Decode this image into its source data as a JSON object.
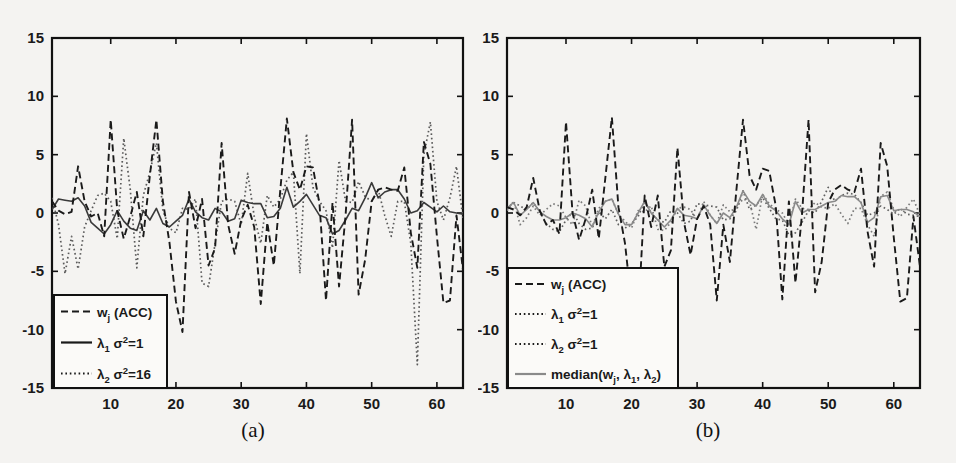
{
  "figure": {
    "background_color": "#f4f3f1",
    "ink_color": "#1a1a1a",
    "panels": [
      "a",
      "b"
    ]
  },
  "panel_a": {
    "caption": "(a)",
    "legend": {
      "items": [
        {
          "label_main": "w",
          "label_sub": "j",
          "label_rest": " (ACC)",
          "style": "dashed"
        },
        {
          "label_main": "λ",
          "label_sub": "1",
          "label_rest": " σ",
          "label_sup": "2",
          "label_tail": "=1",
          "style": "solid"
        },
        {
          "label_main": "λ",
          "label_sub": "2",
          "label_rest": " σ",
          "label_sup": "2",
          "label_tail": "=16",
          "style": "dotted"
        }
      ]
    }
  },
  "panel_b": {
    "caption": "(b)",
    "legend": {
      "items": [
        {
          "label_main": "w",
          "label_sub": "j",
          "label_rest": " (ACC)",
          "style": "dashed"
        },
        {
          "label_main": "λ",
          "label_sub": "1",
          "label_rest": " σ",
          "label_sup": "2",
          "label_tail": "=1",
          "style": "dotted"
        },
        {
          "label_main": "λ",
          "label_sub": "2",
          "label_rest": " σ",
          "label_sup": "2",
          "label_tail": "=1",
          "style": "dotted"
        },
        {
          "label_main": "median(w",
          "label_sub": "j",
          "label_rest": ", λ",
          "label_sup2": "1",
          "label_rest2": ", λ",
          "label_sup3": "2",
          "label_tail": ")",
          "style": "solid-gray"
        }
      ]
    }
  },
  "chart_data": [
    {
      "id": "a",
      "type": "line",
      "title": "(a)",
      "xlabel": "",
      "ylabel": "",
      "xlim": [
        1,
        64
      ],
      "ylim": [
        -15,
        15
      ],
      "xticks": [
        10,
        20,
        30,
        40,
        50,
        60
      ],
      "yticks": [
        15,
        10,
        5,
        0,
        -5,
        -10,
        -15
      ],
      "grid": false,
      "legend_position": "lower-left",
      "series": [
        {
          "name": "w_j (ACC)",
          "style": "dashed",
          "color": "#1a1a1a",
          "values": [
            1.0,
            0.2,
            -0.1,
            0.1,
            4.0,
            1.0,
            -0.3,
            0.0,
            -2.0,
            8.0,
            0.2,
            -2.2,
            -0.3,
            1.8,
            -2.0,
            3.2,
            8.0,
            1.0,
            -2.5,
            -7.6,
            -10.2,
            1.8,
            -1.3,
            1.2,
            -4.5,
            -3.0,
            6.0,
            -1.0,
            -3.5,
            -0.6,
            0.7,
            -1.2,
            -7.8,
            -0.8,
            -4.5,
            2.0,
            8.1,
            3.5,
            2.0,
            4.0,
            3.9,
            0.8,
            -7.5,
            0.9,
            -6.3,
            -0.2,
            8.0,
            -7.0,
            -4.0,
            1.0,
            2.0,
            2.2,
            2.0,
            1.9,
            3.9,
            -1.7,
            -4.7,
            6.1,
            4.2,
            -2.0,
            -7.7,
            -7.5,
            -0.2,
            -4.9
          ]
        },
        {
          "name": "lambda_1 sigma^2=1",
          "style": "solid",
          "color": "#3a3a3a",
          "values": [
            0.3,
            1.2,
            1.1,
            1.0,
            1.3,
            0.6,
            -0.8,
            -1.3,
            -1.8,
            -1.0,
            0.2,
            -0.7,
            -1.3,
            -1.5,
            0.2,
            -0.6,
            0.4,
            -0.9,
            -1.2,
            -0.7,
            -0.2,
            1.2,
            0.1,
            -0.4,
            -0.6,
            0.4,
            0.1,
            -0.7,
            -0.5,
            1.1,
            0.9,
            0.8,
            0.8,
            -0.4,
            -0.3,
            0.4,
            2.2,
            0.5,
            1.0,
            1.6,
            0.7,
            -0.2,
            -0.4,
            -1.8,
            -1.5,
            -0.6,
            0.4,
            0.2,
            1.3,
            2.6,
            1.3,
            1.8,
            2.0,
            2.0,
            1.2,
            0.0,
            0.2,
            0.9,
            0.5,
            0.1,
            0.6,
            0.1,
            0.0,
            -0.1
          ]
        },
        {
          "name": "lambda_2 sigma^2=16",
          "style": "dotted",
          "color": "#5a5a5a",
          "values": [
            1.3,
            -1.0,
            -5.2,
            -2.0,
            -4.8,
            -1.2,
            0.2,
            1.5,
            1.7,
            1.0,
            -2.2,
            6.4,
            2.0,
            -4.7,
            1.5,
            3.5,
            6.0,
            0.2,
            -1.3,
            -1.7,
            0.4,
            0.3,
            1.2,
            -6.0,
            -6.3,
            -2.6,
            1.0,
            1.2,
            1.0,
            -1.0,
            3.4,
            -0.3,
            -2.6,
            1.5,
            0.5,
            1.2,
            2.8,
            3.5,
            -5.2,
            6.8,
            2.2,
            1.0,
            0.2,
            -3.0,
            4.5,
            1.0,
            0.9,
            2.7,
            1.4,
            1.0,
            2.0,
            -0.2,
            -2.0,
            1.0,
            1.0,
            -2.6,
            -13.0,
            5.0,
            7.8,
            1.0,
            -0.6,
            1.3,
            4.0,
            -0.5
          ]
        }
      ]
    },
    {
      "id": "b",
      "type": "line",
      "title": "(b)",
      "xlabel": "",
      "ylabel": "",
      "xlim": [
        1,
        64
      ],
      "ylim": [
        -15,
        15
      ],
      "xticks": [
        10,
        20,
        30,
        40,
        50,
        60
      ],
      "yticks": [
        15,
        10,
        5,
        0,
        -5,
        -10,
        -15
      ],
      "grid": false,
      "legend_position": "lower-left",
      "series": [
        {
          "name": "w_j (ACC)",
          "style": "dashed",
          "color": "#1a1a1a",
          "values": [
            0.5,
            0.3,
            -0.2,
            0.5,
            3.0,
            0.2,
            -1.0,
            -0.6,
            -1.8,
            7.8,
            0.0,
            -2.3,
            -0.5,
            2.0,
            -2.2,
            3.0,
            8.2,
            0.5,
            -2.6,
            -7.8,
            -9.0,
            1.5,
            -1.2,
            1.5,
            -4.6,
            -3.2,
            5.6,
            -0.8,
            -3.6,
            -0.5,
            0.6,
            -1.0,
            -7.5,
            -1.0,
            -4.2,
            2.0,
            8.0,
            3.2,
            2.0,
            3.8,
            3.6,
            0.6,
            -7.4,
            1.0,
            -6.0,
            -0.1,
            8.0,
            -6.8,
            -4.2,
            0.9,
            2.0,
            2.4,
            2.0,
            1.8,
            3.8,
            -1.6,
            -4.6,
            6.0,
            4.0,
            -2.1,
            -7.6,
            -7.3,
            -0.3,
            -4.6
          ]
        },
        {
          "name": "lambda_1 sigma^2=1",
          "style": "dotted",
          "color": "#606060",
          "values": [
            0.4,
            0.9,
            0.6,
            0.3,
            0.9,
            0.1,
            -0.9,
            -1.4,
            -1.6,
            -0.6,
            0.1,
            -0.9,
            -1.4,
            -1.3,
            0.1,
            -0.5,
            0.3,
            -1.0,
            -1.3,
            -0.9,
            -0.3,
            1.0,
            0.0,
            -0.6,
            -0.8,
            0.2,
            0.0,
            -0.9,
            -0.7,
            0.8,
            0.7,
            0.6,
            0.5,
            -0.6,
            -0.5,
            0.2,
            1.9,
            0.3,
            0.7,
            1.3,
            0.4,
            -0.5,
            -0.6,
            -1.9,
            -1.7,
            -0.8,
            0.2,
            0.0,
            1.0,
            2.2,
            1.0,
            1.5,
            1.7,
            1.6,
            0.9,
            -0.2,
            0.0,
            0.6,
            0.3,
            -0.1,
            0.4,
            -0.1,
            -0.2,
            -0.3
          ]
        },
        {
          "name": "lambda_2 sigma^2=1",
          "style": "dotted",
          "color": "#7a7a7a",
          "values": [
            0.2,
            1.0,
            -1.0,
            -0.4,
            0.6,
            -0.2,
            0.3,
            0.8,
            0.6,
            -0.4,
            -1.0,
            1.1,
            0.6,
            -1.2,
            0.4,
            1.0,
            1.2,
            -0.1,
            -0.7,
            -1.3,
            0.2,
            0.1,
            0.6,
            -1.4,
            -1.5,
            -0.8,
            0.4,
            0.5,
            0.3,
            -0.6,
            1.0,
            -0.2,
            -0.9,
            0.7,
            0.1,
            0.5,
            1.2,
            1.0,
            -1.4,
            1.6,
            0.8,
            0.3,
            0.0,
            -1.0,
            1.2,
            0.4,
            0.3,
            0.9,
            0.5,
            0.4,
            0.8,
            -0.1,
            -0.9,
            0.4,
            0.4,
            -1.0,
            -2.0,
            1.4,
            1.8,
            0.3,
            -0.3,
            0.5,
            1.2,
            -0.2
          ]
        },
        {
          "name": "median(w_j, lambda_1, lambda_2)",
          "style": "solid",
          "color": "#8a8a8a",
          "values": [
            0.4,
            0.9,
            -0.2,
            0.3,
            0.9,
            0.1,
            -0.3,
            -0.6,
            -0.6,
            -0.4,
            0.0,
            -0.2,
            -0.5,
            -1.2,
            0.1,
            1.0,
            1.2,
            -0.1,
            -1.0,
            -1.0,
            0.0,
            1.0,
            0.0,
            -0.6,
            -1.2,
            -0.6,
            0.4,
            -0.2,
            -0.3,
            -0.5,
            0.7,
            -0.2,
            -0.9,
            0.0,
            -0.4,
            0.5,
            1.9,
            1.0,
            0.6,
            1.6,
            0.6,
            0.2,
            -0.5,
            -1.0,
            1.0,
            0.0,
            0.3,
            0.3,
            0.6,
            0.9,
            1.0,
            1.5,
            1.4,
            1.4,
            0.9,
            -0.8,
            -0.4,
            1.4,
            1.5,
            0.2,
            0.3,
            0.3,
            0.1,
            -0.3
          ]
        }
      ]
    }
  ]
}
